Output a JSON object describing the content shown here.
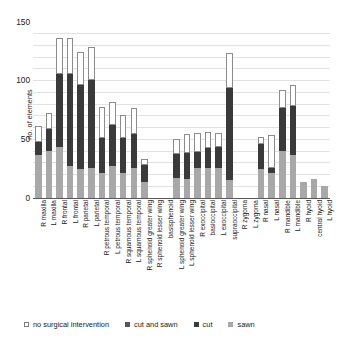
{
  "chart_data": {
    "type": "bar",
    "title": "",
    "xlabel": "",
    "ylabel": "no. of elements",
    "ylim": [
      0,
      150
    ],
    "yticks": [
      0,
      50,
      100,
      150
    ],
    "grid": true,
    "stacked": true,
    "legend_position": "bottom",
    "categories": [
      "R maxilla",
      "L maxilla",
      "R frontal",
      "L frontal",
      "R parietal",
      "L parietal",
      "R petrous temporal",
      "L petrous temporal",
      "R squamous temporal",
      "L squamous temporal",
      "R sphenoid greater wing",
      "R sphenoid lesser wing",
      "basisphenoid",
      "L sphenoid greater wing",
      "L sphenoid lesser wing",
      "R exoccipital",
      "basioccipital",
      "L exoccipital",
      "supraoccipital",
      "R zygoma",
      "L zygoma",
      "R nasal",
      "L nasal",
      "R mandible",
      "L mandible",
      "R hyoid",
      "central hyoid",
      "L hyoid"
    ],
    "series": [
      {
        "name": "sawn",
        "color": "#a8a8a8",
        "values": [
          36,
          40,
          43,
          27,
          24,
          25,
          21,
          27,
          21,
          25,
          13,
          0,
          0,
          17,
          16,
          25,
          25,
          25,
          15,
          0,
          0,
          24,
          21,
          40,
          36,
          13,
          16,
          10
        ]
      },
      {
        "name": "cut",
        "color": "#3a3a3a",
        "values": [
          11,
          18,
          62,
          78,
          72,
          75,
          30,
          35,
          30,
          29,
          15,
          0,
          0,
          20,
          22,
          14,
          17,
          18,
          78,
          0,
          0,
          22,
          4,
          36,
          42,
          0,
          0,
          0
        ]
      },
      {
        "name": "cut and sawn",
        "color": "#575757",
        "values": [
          0,
          0,
          0,
          0,
          0,
          0,
          0,
          0,
          0,
          0,
          0,
          0,
          0,
          0,
          0,
          0,
          0,
          0,
          0,
          0,
          0,
          0,
          0,
          0,
          0,
          0,
          0,
          0
        ]
      },
      {
        "name": "no surgical intervention",
        "color": "#ffffff",
        "values": [
          14,
          14,
          31,
          31,
          28,
          28,
          26,
          19,
          19,
          22,
          5,
          0,
          0,
          13,
          16,
          16,
          14,
          12,
          30,
          0,
          0,
          6,
          28,
          16,
          18,
          0,
          0,
          0
        ]
      }
    ],
    "totals": [
      61,
      72,
      136,
      136,
      124,
      128,
      77,
      81,
      70,
      76,
      33,
      0,
      0,
      50,
      54,
      55,
      56,
      55,
      123,
      0,
      0,
      52,
      53,
      92,
      96,
      13,
      16,
      10
    ]
  },
  "legend": {
    "items": [
      {
        "label": "no surgical intervention",
        "swatch": "none"
      },
      {
        "label": "cut and sawn",
        "swatch": "cutsawn"
      },
      {
        "label": "cut",
        "swatch": "cut"
      },
      {
        "label": "sawn",
        "swatch": "sawn"
      }
    ]
  },
  "axes": {
    "y_title": "no. of elements",
    "y_tick_labels": [
      "150",
      "100",
      "50",
      "0"
    ]
  }
}
